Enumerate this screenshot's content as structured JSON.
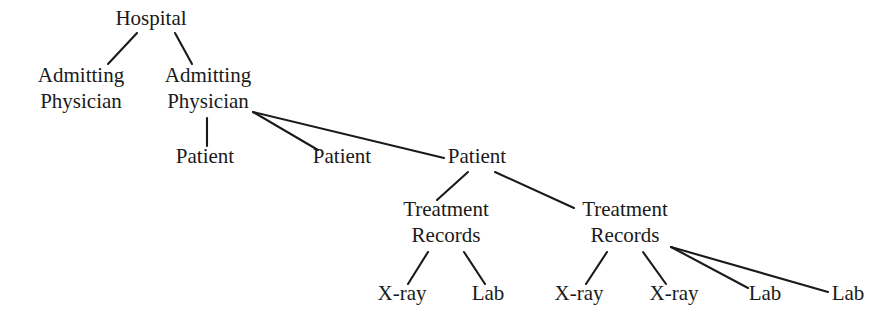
{
  "diagram": {
    "type": "tree",
    "background_color": "#ffffff",
    "line_color": "#1a1a1a",
    "text_color": "#1a1a1a",
    "levels": [
      "Hospital",
      "Admitting Physician",
      "Patient",
      "Treatment Records",
      "X-ray / Lab"
    ],
    "nodes": [
      {
        "id": "hospital",
        "label": "Hospital",
        "lines": [
          "Hospital"
        ],
        "x": 151,
        "y": 25,
        "level": 0
      },
      {
        "id": "admitting-physician-1",
        "label": "Admitting Physician",
        "lines": [
          "Admitting",
          "Physician"
        ],
        "x": 81,
        "y": 82,
        "level": 1
      },
      {
        "id": "admitting-physician-2",
        "label": "Admitting Physician",
        "lines": [
          "Admitting",
          "Physician"
        ],
        "x": 208,
        "y": 82,
        "level": 1
      },
      {
        "id": "patient-1",
        "label": "Patient",
        "lines": [
          "Patient"
        ],
        "x": 205,
        "y": 163,
        "level": 2
      },
      {
        "id": "patient-2",
        "label": "Patient",
        "lines": [
          "Patient"
        ],
        "x": 342,
        "y": 163,
        "level": 2
      },
      {
        "id": "patient-3",
        "label": "Patient",
        "lines": [
          "Patient"
        ],
        "x": 477,
        "y": 163,
        "level": 2
      },
      {
        "id": "treatment-records-1",
        "label": "Treatment Records",
        "lines": [
          "Treatment",
          "Records"
        ],
        "x": 446,
        "y": 216,
        "level": 3
      },
      {
        "id": "treatment-records-2",
        "label": "Treatment Records",
        "lines": [
          "Treatment",
          "Records"
        ],
        "x": 625,
        "y": 216,
        "level": 3
      },
      {
        "id": "xray-1",
        "label": "X-ray",
        "lines": [
          "X-ray"
        ],
        "x": 402,
        "y": 300,
        "level": 4
      },
      {
        "id": "lab-1",
        "label": "Lab",
        "lines": [
          "Lab"
        ],
        "x": 488,
        "y": 300,
        "level": 4
      },
      {
        "id": "xray-2",
        "label": "X-ray",
        "lines": [
          "X-ray"
        ],
        "x": 579,
        "y": 300,
        "level": 4
      },
      {
        "id": "xray-3",
        "label": "X-ray",
        "lines": [
          "X-ray"
        ],
        "x": 674,
        "y": 300,
        "level": 4
      },
      {
        "id": "lab-2",
        "label": "Lab",
        "lines": [
          "Lab"
        ],
        "x": 765,
        "y": 300,
        "level": 4
      },
      {
        "id": "lab-3",
        "label": "Lab",
        "lines": [
          "Lab"
        ],
        "x": 848,
        "y": 300,
        "level": 4
      }
    ],
    "edges": [
      {
        "id": "e-hospital-ap1",
        "from": "hospital",
        "to": "admitting-physician-1",
        "x1": 137,
        "y1": 33,
        "x2": 108,
        "y2": 64
      },
      {
        "id": "e-hospital-ap2",
        "from": "hospital",
        "to": "admitting-physician-2",
        "x1": 175,
        "y1": 33,
        "x2": 192,
        "y2": 64
      },
      {
        "id": "e-ap2-patient1",
        "from": "admitting-physician-2",
        "to": "patient-1",
        "x1": 207,
        "y1": 118,
        "x2": 207,
        "y2": 146
      },
      {
        "id": "e-ap2-patient2",
        "from": "admitting-physician-2",
        "to": "patient-2",
        "x1": 253,
        "y1": 112,
        "x2": 318,
        "y2": 150
      },
      {
        "id": "e-ap2-patient3",
        "from": "admitting-physician-2",
        "to": "patient-3",
        "x1": 253,
        "y1": 112,
        "x2": 444,
        "y2": 158
      },
      {
        "id": "e-patient3-tr1",
        "from": "patient-3",
        "to": "treatment-records-1",
        "x1": 468,
        "y1": 172,
        "x2": 437,
        "y2": 200
      },
      {
        "id": "e-patient3-tr2",
        "from": "patient-3",
        "to": "treatment-records-2",
        "x1": 495,
        "y1": 172,
        "x2": 574,
        "y2": 208
      },
      {
        "id": "e-tr1-xray1",
        "from": "treatment-records-1",
        "to": "xray-1",
        "x1": 428,
        "y1": 252,
        "x2": 408,
        "y2": 284
      },
      {
        "id": "e-tr1-lab1",
        "from": "treatment-records-1",
        "to": "lab-1",
        "x1": 464,
        "y1": 252,
        "x2": 485,
        "y2": 284
      },
      {
        "id": "e-tr2-xray2",
        "from": "treatment-records-2",
        "to": "xray-2",
        "x1": 607,
        "y1": 252,
        "x2": 586,
        "y2": 284
      },
      {
        "id": "e-tr2-xray3",
        "from": "treatment-records-2",
        "to": "xray-3",
        "x1": 643,
        "y1": 252,
        "x2": 666,
        "y2": 284
      },
      {
        "id": "e-tr2-lab2",
        "from": "treatment-records-2",
        "to": "lab-2",
        "x1": 671,
        "y1": 247,
        "x2": 748,
        "y2": 288
      },
      {
        "id": "e-tr2-lab3",
        "from": "treatment-records-2",
        "to": "lab-3",
        "x1": 671,
        "y1": 247,
        "x2": 828,
        "y2": 292
      }
    ]
  }
}
